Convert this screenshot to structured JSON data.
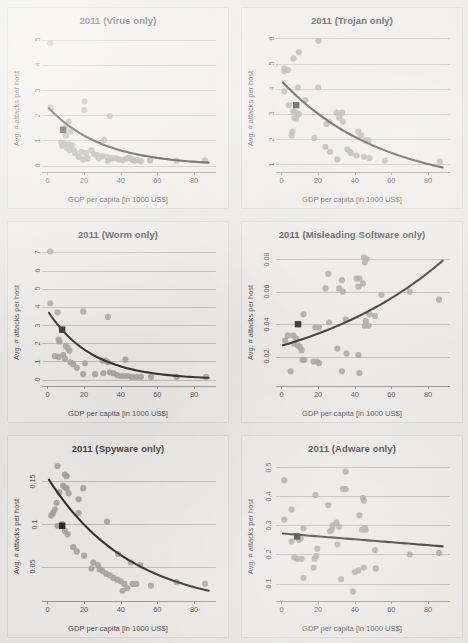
{
  "figure": {
    "axis_label_x": "GDP per capita [in 1000 US$]",
    "axis_label_y": "Avg. # attacks per host",
    "dot_color": "#9a9a98",
    "line_color": "#1a1a1a",
    "marker_color": "#181818",
    "background_color": "#e7e6e4",
    "panel_color": "#eceae7",
    "gridline_color": "#b9b8b6"
  },
  "chart_data": [
    {
      "type": "scatter",
      "title": "2011 (Virus only)",
      "xlabel": "GDP per capita [in 1000 US$]",
      "ylabel": "Avg. # attacks per host",
      "xlim": [
        -3,
        92
      ],
      "ylim": [
        -0.25,
        5.3
      ],
      "xticks": [
        0,
        20,
        40,
        60,
        80
      ],
      "yticks": [
        0,
        1,
        2,
        3,
        4,
        5
      ],
      "grid": true,
      "legend": "none",
      "points": [
        [
          1.5,
          4.85
        ],
        [
          20.2,
          2.55
        ],
        [
          20.0,
          2.2
        ],
        [
          1.6,
          2.3
        ],
        [
          34.0,
          1.97
        ],
        [
          11.5,
          1.75
        ],
        [
          9.5,
          1.5
        ],
        [
          8.5,
          1.45
        ],
        [
          12.5,
          1.35
        ],
        [
          10.0,
          1.2
        ],
        [
          31.0,
          1.02
        ],
        [
          7.5,
          0.92
        ],
        [
          9.0,
          0.88
        ],
        [
          11.5,
          0.85
        ],
        [
          13.5,
          0.8
        ],
        [
          8.0,
          0.78
        ],
        [
          10.5,
          0.72
        ],
        [
          12.0,
          0.62
        ],
        [
          14.5,
          0.6
        ],
        [
          18.5,
          0.55
        ],
        [
          21.0,
          0.5
        ],
        [
          24.0,
          0.62
        ],
        [
          25.5,
          0.45
        ],
        [
          27.0,
          0.42
        ],
        [
          28.0,
          0.3
        ],
        [
          22.0,
          0.28
        ],
        [
          19.5,
          0.25
        ],
        [
          30.0,
          0.38
        ],
        [
          32.5,
          0.35
        ],
        [
          35.0,
          0.3
        ],
        [
          37.0,
          0.3
        ],
        [
          39.0,
          0.25
        ],
        [
          41.0,
          0.22
        ],
        [
          43.0,
          0.28
        ],
        [
          44.5,
          0.32
        ],
        [
          46.0,
          0.25
        ],
        [
          47.5,
          0.2
        ],
        [
          49.0,
          0.22
        ],
        [
          51.0,
          0.18
        ],
        [
          56.0,
          0.2
        ],
        [
          70.5,
          0.2
        ],
        [
          86.0,
          0.2
        ],
        [
          17.0,
          0.35
        ],
        [
          15.0,
          0.5
        ],
        [
          33.0,
          0.2
        ]
      ],
      "fit": {
        "shape": "decay",
        "y0": 2.28,
        "y_end": 0.12
      },
      "highlight_marker": [
        8.5,
        1.42
      ]
    },
    {
      "type": "scatter",
      "title": "2011 (Trojan only)",
      "xlabel": "GDP per capita [in 1000 US$]",
      "ylabel": "Avg. # attacks per host",
      "xlim": [
        -3,
        92
      ],
      "ylim": [
        0.7,
        6.25
      ],
      "xticks": [
        0,
        20,
        40,
        60,
        80
      ],
      "yticks": [
        1,
        2,
        3,
        4,
        5,
        6
      ],
      "grid": true,
      "legend": "none",
      "points": [
        [
          20.2,
          5.9
        ],
        [
          9.5,
          5.45
        ],
        [
          6.5,
          5.2
        ],
        [
          1.5,
          4.8
        ],
        [
          3.5,
          4.75
        ],
        [
          1.5,
          4.7
        ],
        [
          9.0,
          4.05
        ],
        [
          20.0,
          4.05
        ],
        [
          1.6,
          3.9
        ],
        [
          13.0,
          3.55
        ],
        [
          4.0,
          3.35
        ],
        [
          6.5,
          3.1
        ],
        [
          7.5,
          3.05
        ],
        [
          8.5,
          2.95
        ],
        [
          9.5,
          3.0
        ],
        [
          7.0,
          2.85
        ],
        [
          8.0,
          2.8
        ],
        [
          30.0,
          3.05
        ],
        [
          33.0,
          3.05
        ],
        [
          31.5,
          2.85
        ],
        [
          33.5,
          2.7
        ],
        [
          26.0,
          2.7
        ],
        [
          24.5,
          2.6
        ],
        [
          6.0,
          2.3
        ],
        [
          5.5,
          2.15
        ],
        [
          18.0,
          2.05
        ],
        [
          42.0,
          2.3
        ],
        [
          43.5,
          2.15
        ],
        [
          46.0,
          1.95
        ],
        [
          47.5,
          1.95
        ],
        [
          24.0,
          1.7
        ],
        [
          36.0,
          1.6
        ],
        [
          37.5,
          1.5
        ],
        [
          38.0,
          1.45
        ],
        [
          41.0,
          1.35
        ],
        [
          45.0,
          1.3
        ],
        [
          48.0,
          1.25
        ],
        [
          56.5,
          1.15
        ],
        [
          86.5,
          1.12
        ],
        [
          30.5,
          1.2
        ],
        [
          26.5,
          1.5
        ]
      ],
      "fit": {
        "shape": "decay",
        "y0": 4.25,
        "y_end": 0.88
      },
      "highlight_marker": [
        8.0,
        3.35
      ]
    },
    {
      "type": "scatter",
      "title": "2011 (Worm only)",
      "xlabel": "GDP per capita [in 1000 US$]",
      "ylabel": "Avg. # attacks per host",
      "xlim": [
        -3,
        92
      ],
      "ylim": [
        -0.35,
        7.35
      ],
      "xticks": [
        0,
        20,
        40,
        60,
        80
      ],
      "yticks": [
        0,
        1,
        2,
        3,
        4,
        5,
        6,
        7
      ],
      "grid": true,
      "legend": "none",
      "points": [
        [
          1.5,
          7.05
        ],
        [
          1.5,
          4.2
        ],
        [
          5.5,
          3.7
        ],
        [
          19.5,
          3.75
        ],
        [
          33.0,
          3.45
        ],
        [
          8.0,
          2.75
        ],
        [
          6.0,
          2.2
        ],
        [
          6.5,
          2.1
        ],
        [
          10.0,
          1.85
        ],
        [
          11.0,
          1.75
        ],
        [
          12.0,
          1.6
        ],
        [
          4.0,
          1.3
        ],
        [
          6.0,
          1.25
        ],
        [
          8.5,
          1.35
        ],
        [
          9.5,
          1.15
        ],
        [
          12.5,
          0.95
        ],
        [
          20.5,
          0.9
        ],
        [
          30.0,
          1.05
        ],
        [
          31.5,
          1.05
        ],
        [
          33.0,
          0.95
        ],
        [
          42.5,
          1.1
        ],
        [
          19.5,
          0.3
        ],
        [
          26.0,
          0.3
        ],
        [
          30.5,
          0.35
        ],
        [
          34.0,
          0.4
        ],
        [
          36.0,
          0.35
        ],
        [
          38.0,
          0.25
        ],
        [
          40.0,
          0.2
        ],
        [
          42.0,
          0.2
        ],
        [
          44.0,
          0.2
        ],
        [
          46.0,
          0.15
        ],
        [
          48.5,
          0.15
        ],
        [
          51.0,
          0.15
        ],
        [
          56.5,
          0.15
        ],
        [
          70.5,
          0.15
        ],
        [
          86.5,
          0.15
        ],
        [
          14.0,
          0.85
        ],
        [
          16.0,
          0.65
        ]
      ],
      "fit": {
        "shape": "decay",
        "y0": 3.68,
        "y_end": 0.1
      },
      "highlight_marker": [
        8.0,
        2.75
      ]
    },
    {
      "type": "scatter",
      "title": "2011 (Misleading Software only)",
      "xlabel": "GDP per capita [in 1000 US$]",
      "ylabel": "Avg. # attacks per host",
      "xlim": [
        -3,
        92
      ],
      "ylim": [
        0.002,
        0.088
      ],
      "xticks": [
        0,
        20,
        40,
        60,
        80
      ],
      "yticks": [
        0.02,
        0.04,
        0.06,
        0.08
      ],
      "grid": true,
      "legend": "none",
      "points": [
        [
          45.0,
          0.081
        ],
        [
          46.5,
          0.08
        ],
        [
          45.5,
          0.078
        ],
        [
          25.5,
          0.071
        ],
        [
          41.0,
          0.068
        ],
        [
          42.5,
          0.068
        ],
        [
          33.0,
          0.067
        ],
        [
          44.5,
          0.065
        ],
        [
          42.0,
          0.063
        ],
        [
          24.0,
          0.062
        ],
        [
          31.5,
          0.062
        ],
        [
          33.5,
          0.06
        ],
        [
          70.0,
          0.06
        ],
        [
          54.5,
          0.058
        ],
        [
          86.0,
          0.055
        ],
        [
          12.0,
          0.046
        ],
        [
          48.0,
          0.046
        ],
        [
          51.0,
          0.045
        ],
        [
          35.0,
          0.043
        ],
        [
          46.0,
          0.042
        ],
        [
          26.0,
          0.041
        ],
        [
          9.5,
          0.04
        ],
        [
          47.5,
          0.039
        ],
        [
          45.5,
          0.039
        ],
        [
          18.5,
          0.038
        ],
        [
          20.5,
          0.038
        ],
        [
          3.5,
          0.033
        ],
        [
          6.5,
          0.033
        ],
        [
          8.0,
          0.031
        ],
        [
          2.0,
          0.03
        ],
        [
          7.0,
          0.028
        ],
        [
          9.0,
          0.027
        ],
        [
          10.0,
          0.026
        ],
        [
          11.0,
          0.024
        ],
        [
          30.5,
          0.025
        ],
        [
          35.5,
          0.022
        ],
        [
          42.0,
          0.021
        ],
        [
          11.5,
          0.018
        ],
        [
          12.5,
          0.018
        ],
        [
          17.5,
          0.017
        ],
        [
          19.5,
          0.017
        ],
        [
          20.5,
          0.016
        ],
        [
          5.0,
          0.011
        ],
        [
          33.0,
          0.011
        ],
        [
          42.5,
          0.01
        ]
      ],
      "fit": {
        "shape": "growth",
        "y0": 0.027,
        "y_end": 0.079
      },
      "highlight_marker": [
        9.0,
        0.04
      ]
    },
    {
      "type": "scatter",
      "title": "2011 (Spyware only)",
      "xlabel": "GDP per capita [in 1000 US$]",
      "ylabel": "Avg. # attacks per host",
      "xlim": [
        -3,
        92
      ],
      "ylim": [
        0.01,
        0.175
      ],
      "xticks": [
        0,
        20,
        40,
        60,
        80
      ],
      "yticks": [
        0.05,
        0.1,
        0.15
      ],
      "grid": true,
      "legend": "none",
      "points": [
        [
          5.5,
          0.168
        ],
        [
          9.5,
          0.158
        ],
        [
          10.5,
          0.156
        ],
        [
          8.5,
          0.145
        ],
        [
          9.5,
          0.143
        ],
        [
          10.5,
          0.142
        ],
        [
          19.5,
          0.142
        ],
        [
          6.5,
          0.137
        ],
        [
          11.5,
          0.136
        ],
        [
          17.0,
          0.129
        ],
        [
          5.0,
          0.125
        ],
        [
          4.0,
          0.117
        ],
        [
          3.0,
          0.113
        ],
        [
          2.0,
          0.11
        ],
        [
          17.0,
          0.113
        ],
        [
          32.5,
          0.103
        ],
        [
          8.0,
          0.1
        ],
        [
          5.5,
          0.098
        ],
        [
          9.5,
          0.092
        ],
        [
          11.0,
          0.088
        ],
        [
          14.0,
          0.073
        ],
        [
          16.0,
          0.068
        ],
        [
          20.0,
          0.063
        ],
        [
          38.5,
          0.065
        ],
        [
          25.0,
          0.055
        ],
        [
          24.0,
          0.048
        ],
        [
          27.5,
          0.052
        ],
        [
          28.5,
          0.047
        ],
        [
          30.0,
          0.045
        ],
        [
          45.5,
          0.055
        ],
        [
          50.5,
          0.052
        ],
        [
          32.0,
          0.042
        ],
        [
          34.0,
          0.04
        ],
        [
          36.0,
          0.037
        ],
        [
          38.0,
          0.035
        ],
        [
          40.0,
          0.033
        ],
        [
          42.0,
          0.03
        ],
        [
          43.5,
          0.025
        ],
        [
          41.0,
          0.022
        ],
        [
          46.5,
          0.03
        ],
        [
          48.5,
          0.03
        ],
        [
          56.5,
          0.028
        ],
        [
          70.5,
          0.032
        ],
        [
          86.0,
          0.03
        ]
      ],
      "fit": {
        "shape": "decay",
        "y0": 0.152,
        "y_end": 0.022
      },
      "highlight_marker": [
        8.0,
        0.098
      ]
    },
    {
      "type": "scatter",
      "title": "2011 (Adware only)",
      "xlabel": "GDP per capita [in 1000 US$]",
      "ylabel": "Avg. # attacks per host",
      "xlim": [
        -3,
        92
      ],
      "ylim": [
        0.04,
        0.525
      ],
      "xticks": [
        0,
        20,
        40,
        60,
        80
      ],
      "yticks": [
        0.1,
        0.2,
        0.3,
        0.4,
        0.5
      ],
      "grid": true,
      "legend": "none",
      "points": [
        [
          35.0,
          0.485
        ],
        [
          1.5,
          0.455
        ],
        [
          33.5,
          0.425
        ],
        [
          35.0,
          0.425
        ],
        [
          18.5,
          0.405
        ],
        [
          44.5,
          0.395
        ],
        [
          45.0,
          0.385
        ],
        [
          25.5,
          0.37
        ],
        [
          5.5,
          0.355
        ],
        [
          1.5,
          0.32
        ],
        [
          42.5,
          0.335
        ],
        [
          30.0,
          0.31
        ],
        [
          28.0,
          0.3
        ],
        [
          31.5,
          0.295
        ],
        [
          12.0,
          0.29
        ],
        [
          44.0,
          0.285
        ],
        [
          46.0,
          0.285
        ],
        [
          45.5,
          0.29
        ],
        [
          26.5,
          0.28
        ],
        [
          27.5,
          0.285
        ],
        [
          8.5,
          0.265
        ],
        [
          9.5,
          0.25
        ],
        [
          10.5,
          0.255
        ],
        [
          5.5,
          0.245
        ],
        [
          30.5,
          0.235
        ],
        [
          19.5,
          0.22
        ],
        [
          51.0,
          0.215
        ],
        [
          70.0,
          0.2
        ],
        [
          86.0,
          0.205
        ],
        [
          7.0,
          0.19
        ],
        [
          8.5,
          0.185
        ],
        [
          11.0,
          0.185
        ],
        [
          18.0,
          0.185
        ],
        [
          19.0,
          0.195
        ],
        [
          17.5,
          0.155
        ],
        [
          40.0,
          0.14
        ],
        [
          42.0,
          0.145
        ],
        [
          45.0,
          0.155
        ],
        [
          51.5,
          0.152
        ],
        [
          12.0,
          0.12
        ],
        [
          32.5,
          0.115
        ],
        [
          39.0,
          0.072
        ]
      ],
      "fit": {
        "shape": "linear",
        "y0": 0.272,
        "y_end": 0.228
      },
      "highlight_marker": [
        8.5,
        0.262
      ]
    }
  ]
}
